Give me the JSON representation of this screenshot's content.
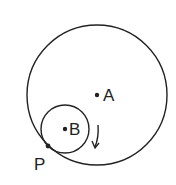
{
  "diagram": {
    "colors": {
      "stroke": "#222222",
      "background": "#ffffff"
    },
    "large_circle": {
      "center_label": "A",
      "cx": 97,
      "cy": 95,
      "r": 70
    },
    "small_circle": {
      "center_label": "B",
      "cx": 65,
      "cy": 129,
      "r": 24
    },
    "points": [
      {
        "label": "A",
        "x": 97,
        "y": 95
      },
      {
        "label": "B",
        "x": 65,
        "y": 129
      },
      {
        "label": "P",
        "x": 48,
        "y": 146
      }
    ],
    "arrow": {
      "direction": "clockwise-down"
    }
  }
}
